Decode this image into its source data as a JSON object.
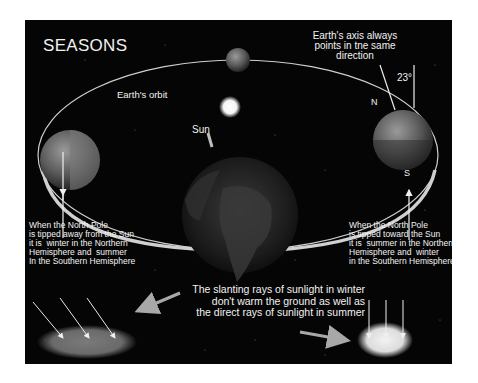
{
  "title": "SEASONS",
  "labels": {
    "axis_note": "Earth's axis always\npoints in tne same\ndirection",
    "orbit": "Earth's orbit",
    "sun": "Sun",
    "tilt_degrees": "23°",
    "north": "N",
    "south": "S"
  },
  "captions": {
    "left": "When the North Pole\nis tipped away from the Sun\nit is  winter in the Northern\nHemisphere and  summer\nIn the Southern Hemisphere",
    "right": "When the North Pole\nis tipped toward the Sun\nit is  summer in the Northern\nHemisphere and  winter\nin the Southern Hemisphere",
    "rays": "The slanting rays of sunlight in winter\ndon't warm the ground as well as\nthe direct rays of sunlight in summer"
  },
  "colors": {
    "background": "#050505",
    "text": "#f2f2f2",
    "orbit": "#d8d8d8",
    "sun": "#ffffff",
    "arrow": "#a8a8a8"
  }
}
